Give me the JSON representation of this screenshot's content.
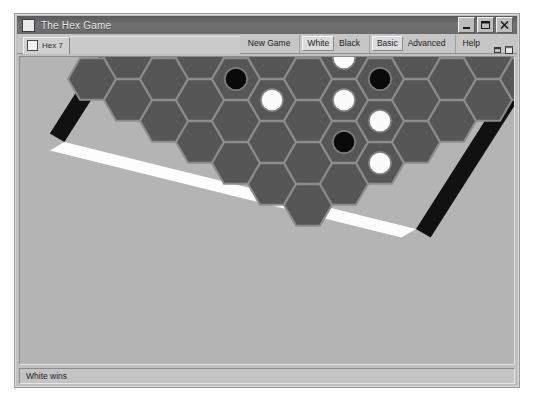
{
  "window": {
    "title": "The Hex Game",
    "title_icon": "app-window-icon",
    "controls": [
      {
        "name": "minimize-button",
        "glyph": "minimize-icon"
      },
      {
        "name": "maximize-button",
        "glyph": "maximize-icon"
      },
      {
        "name": "close-button",
        "glyph": "close-icon"
      }
    ]
  },
  "document_tab": {
    "label": "Hex 7",
    "icon": "document-icon"
  },
  "menu": {
    "groups": [
      {
        "name": "game-group",
        "items": [
          {
            "label": "New Game",
            "state": "flat"
          }
        ]
      },
      {
        "name": "player-group",
        "items": [
          {
            "label": "White",
            "state": "raised"
          },
          {
            "label": "Black",
            "state": "flat"
          }
        ]
      },
      {
        "name": "level-group",
        "items": [
          {
            "label": "Basic",
            "state": "raised"
          },
          {
            "label": "Advanced",
            "state": "flat"
          }
        ]
      },
      {
        "name": "help-group",
        "items": [
          {
            "label": "Help",
            "state": "flat"
          }
        ]
      }
    ],
    "icons": [
      {
        "name": "restore-window-icon"
      },
      {
        "name": "new-window-icon"
      }
    ]
  },
  "status": {
    "text": "White wins"
  },
  "colors": {
    "desktop": "#ffffff",
    "window_face": "#c0c0c0",
    "titlebar": "#6b6b6b",
    "titlebar_text": "#e8e8e8",
    "canvas": "#b4b4b4",
    "cell_fill": "#565656",
    "cell_edge": "#8d8d8d",
    "border_black": "#111111",
    "border_white": "#fdfdfd",
    "stone_black": "#0a0a0a",
    "stone_white": "#fbfbfb",
    "stone_rim": "#7d7d7d"
  },
  "board": {
    "game": "Hex",
    "size": 7,
    "orientation": "rhombus-diamond",
    "edge_owner": {
      "top_left": "black",
      "bottom_right": "black",
      "top_right": "white",
      "bottom_left": "white"
    },
    "result": "White wins",
    "geometry": {
      "hex_radius": 24,
      "origin_x": 72,
      "origin_y": 22,
      "col_dx": 36,
      "col_dy": -21,
      "row_dx": 36,
      "row_dy": 21
    },
    "cells": [
      {
        "row": 0,
        "col": 0,
        "stone": "empty"
      },
      {
        "row": 0,
        "col": 1,
        "stone": "empty"
      },
      {
        "row": 0,
        "col": 2,
        "stone": "black"
      },
      {
        "row": 0,
        "col": 3,
        "stone": "empty"
      },
      {
        "row": 0,
        "col": 4,
        "stone": "black"
      },
      {
        "row": 0,
        "col": 5,
        "stone": "empty"
      },
      {
        "row": 0,
        "col": 6,
        "stone": "empty"
      },
      {
        "row": 1,
        "col": 0,
        "stone": "empty"
      },
      {
        "row": 1,
        "col": 1,
        "stone": "empty"
      },
      {
        "row": 1,
        "col": 2,
        "stone": "empty"
      },
      {
        "row": 1,
        "col": 3,
        "stone": "empty"
      },
      {
        "row": 1,
        "col": 4,
        "stone": "empty"
      },
      {
        "row": 1,
        "col": 5,
        "stone": "empty"
      },
      {
        "row": 1,
        "col": 6,
        "stone": "white"
      },
      {
        "row": 2,
        "col": 0,
        "stone": "empty"
      },
      {
        "row": 2,
        "col": 1,
        "stone": "empty"
      },
      {
        "row": 2,
        "col": 2,
        "stone": "black"
      },
      {
        "row": 2,
        "col": 3,
        "stone": "empty"
      },
      {
        "row": 2,
        "col": 4,
        "stone": "black"
      },
      {
        "row": 2,
        "col": 5,
        "stone": "white"
      },
      {
        "row": 2,
        "col": 6,
        "stone": "black"
      },
      {
        "row": 3,
        "col": 0,
        "stone": "empty"
      },
      {
        "row": 3,
        "col": 1,
        "stone": "empty"
      },
      {
        "row": 3,
        "col": 2,
        "stone": "white"
      },
      {
        "row": 3,
        "col": 3,
        "stone": "empty"
      },
      {
        "row": 3,
        "col": 4,
        "stone": "white"
      },
      {
        "row": 3,
        "col": 5,
        "stone": "white"
      },
      {
        "row": 3,
        "col": 6,
        "stone": "empty"
      },
      {
        "row": 4,
        "col": 0,
        "stone": "empty"
      },
      {
        "row": 4,
        "col": 1,
        "stone": "empty"
      },
      {
        "row": 4,
        "col": 2,
        "stone": "empty"
      },
      {
        "row": 4,
        "col": 3,
        "stone": "white"
      },
      {
        "row": 4,
        "col": 4,
        "stone": "black"
      },
      {
        "row": 4,
        "col": 5,
        "stone": "empty"
      },
      {
        "row": 4,
        "col": 6,
        "stone": "empty"
      },
      {
        "row": 5,
        "col": 0,
        "stone": "empty"
      },
      {
        "row": 5,
        "col": 1,
        "stone": "empty"
      },
      {
        "row": 5,
        "col": 2,
        "stone": "black"
      },
      {
        "row": 5,
        "col": 3,
        "stone": "white"
      },
      {
        "row": 5,
        "col": 4,
        "stone": "empty"
      },
      {
        "row": 5,
        "col": 5,
        "stone": "empty"
      },
      {
        "row": 5,
        "col": 6,
        "stone": "empty"
      },
      {
        "row": 6,
        "col": 0,
        "stone": "empty"
      },
      {
        "row": 6,
        "col": 1,
        "stone": "empty"
      },
      {
        "row": 6,
        "col": 2,
        "stone": "white"
      },
      {
        "row": 6,
        "col": 3,
        "stone": "empty"
      },
      {
        "row": 6,
        "col": 4,
        "stone": "empty"
      },
      {
        "row": 6,
        "col": 5,
        "stone": "empty"
      },
      {
        "row": 6,
        "col": 6,
        "stone": "empty"
      },
      {
        "row": 7,
        "col": 2,
        "stone": "black"
      },
      {
        "row": 7,
        "col": 3,
        "stone": "white"
      }
    ]
  }
}
